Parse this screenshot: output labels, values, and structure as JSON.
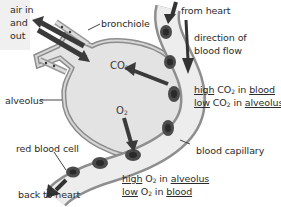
{
  "diagram": {
    "colors": {
      "alveolus_fill": "#e4e4e4",
      "wall": "#9a9a9a",
      "capillary_fill": "#ececec",
      "arrow": "#3c3c3c",
      "rbc": "#4a4a4a",
      "label_box": "#eeeeee"
    },
    "labels": {
      "air_in": "air in",
      "and": "and",
      "out": "out",
      "bronchiole": "bronchiole",
      "from_heart": "from heart",
      "direction_1": "direction of",
      "direction_2": "blood flow",
      "alveolus": "alveolus",
      "red_blood_cell": "red blood cell",
      "blood_capillary": "blood capillary",
      "back_to_heart": "back to heart"
    },
    "gases": {
      "co2_main": "CO",
      "co2_sub": "2",
      "o2_main": "O",
      "o2_sub": "2"
    },
    "co2_note": {
      "line1": {
        "w1": "high",
        "w2": " CO",
        "sub": "2",
        "w3": " in ",
        "w4": "blood"
      },
      "line2": {
        "w1": "low",
        "w2": " CO",
        "sub": "2",
        "w3": " in ",
        "w4": "alveolus"
      }
    },
    "o2_note": {
      "line1": {
        "w1": "high",
        "w2": " O",
        "sub": "2",
        "w3": " in ",
        "w4": "alveolus"
      },
      "line2": {
        "w1": "low",
        "w2": " O",
        "sub": "2",
        "w3": " in ",
        "w4": "blood"
      }
    }
  }
}
